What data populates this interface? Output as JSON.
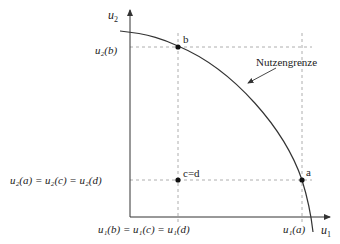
{
  "diagram": {
    "axes": {
      "x_label": "u",
      "x_sub": "1",
      "y_label": "u",
      "y_sub": "2"
    },
    "curve_label": "Nutzengrenze",
    "points": {
      "a": "a",
      "b": "b",
      "cd": "c=d"
    },
    "tick_labels": {
      "u2_b": "u₂(b)",
      "u2_acd": "u₂(a) = u₂(c) = u₂(d)",
      "u1_bcd": "u₁(b) = u₁(c) = u₁(d)",
      "u1_a": "u₁(a)"
    },
    "colors": {
      "line": "#333333",
      "guide": "#999999"
    }
  }
}
